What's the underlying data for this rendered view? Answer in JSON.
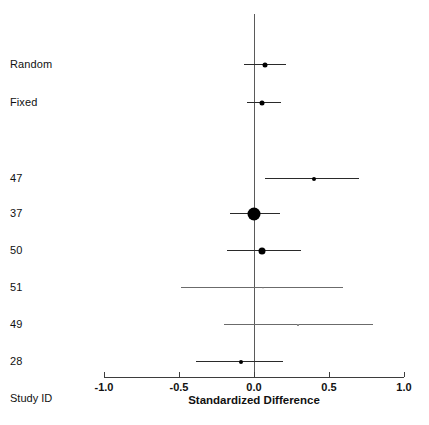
{
  "figure": {
    "kind": "forest-plot",
    "corner_label": "Study ID",
    "axis_title": "Standardized Difference",
    "line_color": "#2a2a2a",
    "marker_color": "#000000",
    "reference_color": "#5a5a5a",
    "background": "#ffffff"
  },
  "chart_data": {
    "type": "scatter",
    "title": "",
    "subtitle": "",
    "xlabel": "Standardized Difference",
    "ylabel": "Study ID",
    "xlim": [
      -1.0,
      1.0
    ],
    "xticks": [
      -1.0,
      -0.5,
      0.0,
      0.5,
      1.0
    ],
    "xtick_labels": [
      "-1.0",
      "-0.5",
      "0.0",
      "0.5",
      "1.0"
    ],
    "grid": false,
    "legend": null,
    "reference_line": 0.0,
    "categories": [
      "Random",
      "Fixed",
      "47",
      "37",
      "50",
      "51",
      "49",
      "28"
    ],
    "rows": [
      {
        "label": "Random",
        "type": "summary",
        "estimate": 0.07,
        "ci_low": -0.07,
        "ci_high": 0.21,
        "marker_size_px": 5,
        "faint": false
      },
      {
        "label": "Fixed",
        "type": "summary",
        "estimate": 0.05,
        "ci_low": -0.05,
        "ci_high": 0.18,
        "marker_size_px": 5,
        "faint": false
      },
      {
        "label": "47",
        "type": "study",
        "estimate": 0.4,
        "ci_low": 0.07,
        "ci_high": 0.7,
        "marker_size_px": 4,
        "faint": false
      },
      {
        "label": "37",
        "type": "study",
        "estimate": 0.0,
        "ci_low": -0.16,
        "ci_high": 0.17,
        "marker_size_px": 13,
        "faint": false
      },
      {
        "label": "50",
        "type": "study",
        "estimate": 0.05,
        "ci_low": -0.18,
        "ci_high": 0.31,
        "marker_size_px": 7,
        "faint": false
      },
      {
        "label": "51",
        "type": "study",
        "estimate": 0.06,
        "ci_low": -0.49,
        "ci_high": 0.59,
        "marker_size_px": 1,
        "faint": true
      },
      {
        "label": "49",
        "type": "study",
        "estimate": 0.29,
        "ci_low": -0.2,
        "ci_high": 0.79,
        "marker_size_px": 2,
        "faint": true
      },
      {
        "label": "28",
        "type": "study",
        "estimate": -0.09,
        "ci_low": -0.39,
        "ci_high": 0.19,
        "marker_size_px": 4,
        "faint": false
      }
    ]
  },
  "layout": {
    "plot_left_px": 104,
    "plot_right_px": 404,
    "axis_y_px": 377,
    "ref_line_top_px": 14,
    "label_x_px": 10,
    "row_y_px": [
      64,
      102,
      178,
      213,
      250,
      287,
      324,
      361
    ],
    "tick_label_y_px": 381,
    "axis_title_y_px": 394,
    "corner_label_y_px": 392
  }
}
